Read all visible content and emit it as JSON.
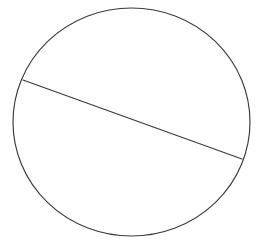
{
  "figure": {
    "background_color": "#ffffff",
    "width": 258,
    "height": 244
  },
  "chart_data": {
    "type": "diagram",
    "xlabel": "",
    "ylabel": "",
    "grid": false,
    "legend": null,
    "annotations": [],
    "tick_labels": [],
    "xlim": [
      0,
      258
    ],
    "ylim": [
      0,
      244
    ],
    "shapes": [
      {
        "name": "circle",
        "kind": "ellipse",
        "center_x": 131.5,
        "center_y": 122,
        "radius_x": 118.5,
        "radius_y": 114,
        "stroke_color": "#3a3a3a",
        "stroke_width": 1.15,
        "fill": "none"
      },
      {
        "name": "chord",
        "kind": "line",
        "x1": 23,
        "y1": 80,
        "x2": 242,
        "y2": 159,
        "stroke_color": "#3a3a3a",
        "stroke_width": 1.15,
        "fill": "none"
      }
    ]
  }
}
